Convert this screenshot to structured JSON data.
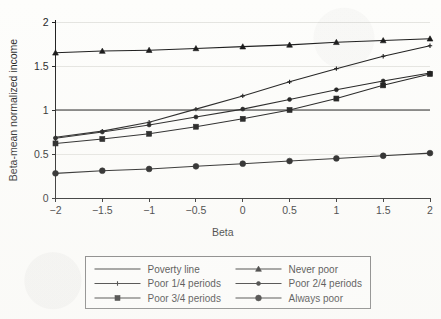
{
  "chart_data": {
    "type": "line",
    "title": "",
    "xlabel": "Beta",
    "ylabel": "Beta-mean normalized income",
    "xlim": [
      -2,
      2
    ],
    "ylim": [
      0,
      2
    ],
    "grid": true,
    "legend_position": "bottom",
    "x": [
      -2,
      -1.5,
      -1,
      -0.5,
      0,
      0.5,
      1,
      1.5,
      2
    ],
    "xticklabels": [
      "−2",
      "−1.5",
      "−1",
      "−0.5",
      "0",
      "0.5",
      "1",
      "1.5",
      "2"
    ],
    "yticks": [
      0,
      0.5,
      1,
      1.5,
      2
    ],
    "yticklabels": [
      "0",
      "0.5",
      "1",
      "1.5",
      "2"
    ],
    "series": [
      {
        "name": "Poverty line",
        "marker": "none",
        "values": [
          1,
          1,
          1,
          1,
          1,
          1,
          1,
          1,
          1
        ]
      },
      {
        "name": "Never poor",
        "marker": "triangle",
        "values": [
          1.65,
          1.67,
          1.68,
          1.7,
          1.72,
          1.74,
          1.77,
          1.79,
          1.81
        ]
      },
      {
        "name": "Poor 1/4 periods",
        "marker": "cross",
        "values": [
          0.69,
          0.76,
          0.86,
          1.01,
          1.16,
          1.32,
          1.47,
          1.61,
          1.73
        ]
      },
      {
        "name": "Poor 2/4 periods",
        "marker": "dot",
        "values": [
          0.68,
          0.75,
          0.83,
          0.92,
          1.01,
          1.12,
          1.23,
          1.33,
          1.42
        ]
      },
      {
        "name": "Poor 3/4 periods",
        "marker": "square",
        "values": [
          0.62,
          0.67,
          0.73,
          0.81,
          0.9,
          1.0,
          1.13,
          1.28,
          1.41
        ]
      },
      {
        "name": "Always poor",
        "marker": "circle",
        "values": [
          0.28,
          0.31,
          0.33,
          0.36,
          0.39,
          0.42,
          0.45,
          0.48,
          0.51
        ]
      }
    ],
    "legend": [
      {
        "label": "Poverty line",
        "marker": "none"
      },
      {
        "label": "Never poor",
        "marker": "triangle"
      },
      {
        "label": "Poor 1/4 periods",
        "marker": "cross"
      },
      {
        "label": "Poor 2/4 periods",
        "marker": "dot"
      },
      {
        "label": "Poor 3/4 periods",
        "marker": "square"
      },
      {
        "label": "Always poor",
        "marker": "circle"
      }
    ],
    "colors": {
      "line": "#151515",
      "axis": "#1a1a1a",
      "grid": "#d8d8d4",
      "background": "#fdfdfb"
    }
  }
}
